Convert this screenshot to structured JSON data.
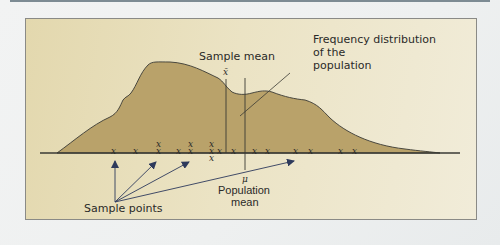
{
  "figure": {
    "labels": {
      "sample_mean": "Sample mean",
      "sample_mean_symbol": "x̄",
      "population_mean_symbol": "μ",
      "population_mean_line1": "Population",
      "population_mean_line2": "mean",
      "freq_dist_line1": "Frequency distribution",
      "freq_dist_line2": "of the",
      "freq_dist_line3": "population",
      "sample_points": "Sample points"
    },
    "sample_marker": "x",
    "colors": {
      "panel_bg": "#e6dcb4",
      "distribution_fill": "#b9a26a",
      "outline": "#3a3a34",
      "arrow": "#2e3a5c"
    }
  }
}
